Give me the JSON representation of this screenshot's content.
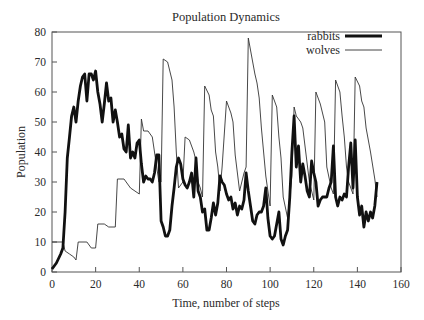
{
  "chart_data": {
    "type": "line",
    "title": "Population Dynamics",
    "xlabel": "Time, number of steps",
    "ylabel": "Population",
    "xlim": [
      0,
      160
    ],
    "ylim": [
      0,
      80
    ],
    "xticks": [
      0,
      20,
      40,
      60,
      80,
      100,
      120,
      140,
      160
    ],
    "yticks": [
      0,
      10,
      20,
      30,
      40,
      50,
      60,
      70,
      80
    ],
    "grid": false,
    "legend_position": "upper right",
    "series": [
      {
        "name": "rabbits",
        "style": "thick",
        "color": "#111111",
        "x": [
          0,
          2,
          4,
          5,
          6,
          7,
          8,
          9,
          10,
          11,
          12,
          13,
          14,
          15,
          16,
          17,
          18,
          19,
          20,
          21,
          22,
          23,
          24,
          25,
          26,
          27,
          28,
          29,
          30,
          31,
          32,
          33,
          34,
          35,
          36,
          37,
          38,
          39,
          40,
          41,
          42,
          43,
          44,
          45,
          46,
          47,
          48,
          49,
          50,
          51,
          52,
          53,
          54,
          55,
          56,
          57,
          58,
          59,
          60,
          61,
          62,
          63,
          64,
          65,
          66,
          67,
          68,
          69,
          70,
          71,
          72,
          73,
          74,
          75,
          76,
          77,
          78,
          79,
          80,
          81,
          82,
          83,
          84,
          85,
          86,
          87,
          88,
          89,
          90,
          91,
          92,
          93,
          94,
          95,
          96,
          97,
          98,
          99,
          100,
          101,
          102,
          103,
          104,
          105,
          106,
          107,
          108,
          109,
          110,
          111,
          112,
          113,
          114,
          115,
          116,
          117,
          118,
          119,
          120,
          121,
          122,
          123,
          124,
          125,
          126,
          127,
          128,
          129,
          130,
          131,
          132,
          133,
          134,
          135,
          136,
          137,
          138,
          139,
          140,
          141,
          142,
          143,
          144,
          145,
          146,
          147,
          148,
          149
        ],
        "values": [
          1,
          3,
          6,
          8,
          20,
          38,
          45,
          52,
          55,
          50,
          57,
          62,
          65,
          66,
          57,
          66,
          66,
          64,
          67,
          60,
          56,
          50,
          56,
          63,
          57,
          58,
          50,
          54,
          50,
          45,
          46,
          41,
          40,
          49,
          38,
          40,
          38,
          43,
          44,
          36,
          30,
          32,
          31,
          31,
          30,
          33,
          39,
          39,
          17,
          15,
          12,
          12,
          14,
          22,
          28,
          35,
          38,
          36,
          31,
          29,
          28,
          30,
          33,
          25,
          38,
          27,
          25,
          20,
          21,
          14,
          14,
          18,
          23,
          19,
          23,
          32,
          30,
          29,
          26,
          24,
          25,
          21,
          23,
          19,
          22,
          21,
          24,
          33,
          27,
          22,
          17,
          16,
          19,
          20,
          20,
          22,
          28,
          18,
          12,
          11,
          12,
          16,
          20,
          11,
          9,
          12,
          14,
          25,
          40,
          52,
          35,
          42,
          30,
          36,
          32,
          27,
          25,
          37,
          33,
          30,
          22,
          24,
          25,
          25,
          25,
          28,
          30,
          42,
          25,
          22,
          25,
          24,
          26,
          25,
          35,
          43,
          28,
          44,
          25,
          19,
          22,
          15,
          20,
          17,
          20,
          18,
          22,
          30
        ]
      },
      {
        "name": "wolves",
        "style": "thin",
        "color": "#333333",
        "x": [
          0,
          5,
          6,
          8,
          10,
          11,
          12,
          16,
          18,
          20,
          21,
          24,
          26,
          29,
          30,
          33,
          36,
          40,
          41,
          42,
          44,
          46,
          48,
          49,
          50,
          51,
          53,
          55,
          56,
          57,
          58,
          60,
          61,
          63,
          65,
          66,
          67,
          68,
          69,
          70,
          72,
          73,
          74,
          75,
          76,
          77,
          78,
          80,
          82,
          83,
          84,
          85,
          86,
          87,
          88,
          89,
          90,
          92,
          93,
          94,
          95,
          96,
          98,
          99,
          100,
          101,
          102,
          103,
          104,
          105,
          106,
          108,
          110,
          111,
          112,
          114,
          115,
          116,
          118,
          120,
          121,
          123,
          125,
          126,
          128,
          129,
          130,
          132,
          133,
          134,
          135,
          136,
          138,
          139,
          141,
          142,
          143,
          144,
          146,
          148,
          149
        ],
        "values": [
          10,
          10,
          7,
          6,
          5,
          4,
          10,
          10,
          8,
          8,
          16,
          16,
          15,
          15,
          31,
          31,
          28,
          26,
          51,
          47,
          47,
          45,
          35,
          30,
          30,
          71,
          70,
          64,
          55,
          40,
          28,
          30,
          45,
          44,
          40,
          37,
          30,
          28,
          25,
          62,
          59,
          54,
          52,
          40,
          35,
          27,
          35,
          57,
          53,
          50,
          39,
          33,
          27,
          30,
          33,
          35,
          78,
          70,
          66,
          63,
          58,
          48,
          32,
          27,
          22,
          59,
          57,
          55,
          45,
          38,
          25,
          18,
          32,
          55,
          52,
          50,
          48,
          42,
          30,
          24,
          60,
          56,
          50,
          35,
          28,
          26,
          64,
          60,
          52,
          45,
          35,
          30,
          26,
          65,
          62,
          57,
          55,
          48,
          40,
          31,
          25
        ]
      }
    ]
  }
}
